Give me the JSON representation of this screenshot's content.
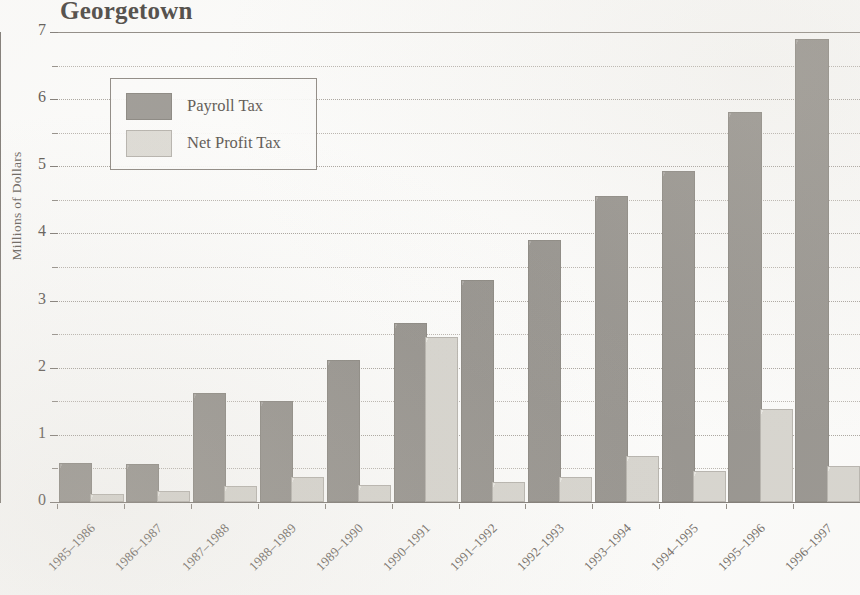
{
  "chart_data": {
    "type": "bar",
    "title": "Georgetown",
    "subtitle": "",
    "xlabel": "",
    "ylabel": "Millions of Dollars",
    "ylim": [
      0,
      7
    ],
    "ytick_labels": [
      "0",
      "1",
      "2",
      "3",
      "4",
      "5",
      "6",
      "7"
    ],
    "ytick_values": [
      0,
      1,
      2,
      3,
      4,
      5,
      6,
      7
    ],
    "minor_tick_values": [
      0.5,
      1.5,
      2.5,
      3.5,
      4.5,
      5.5,
      6.5
    ],
    "grid": true,
    "legend_position": "upper left",
    "categories": [
      "1985-1986",
      "1986-1987",
      "1987-1988",
      "1988-1989",
      "1989-1990",
      "1990-1991",
      "1991-1992",
      "1992-1993",
      "1993-1994",
      "1994-1995",
      "1995-1996",
      "1996-1997"
    ],
    "series": [
      {
        "name": "Payroll Tax",
        "color": "#9d9a95",
        "values": [
          0.55,
          0.54,
          1.6,
          1.47,
          2.08,
          2.63,
          3.28,
          3.87,
          4.53,
          4.9,
          5.78,
          6.87
        ]
      },
      {
        "name": "Net Profit Tax",
        "color": "#dedcd6",
        "values": [
          0.09,
          0.13,
          0.21,
          0.35,
          0.22,
          2.43,
          0.27,
          0.35,
          0.66,
          0.43,
          1.36,
          0.51
        ]
      }
    ]
  },
  "legend": {
    "entries": [
      {
        "label": "Payroll Tax"
      },
      {
        "label": "Net Profit Tax"
      }
    ]
  }
}
